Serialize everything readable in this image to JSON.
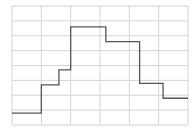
{
  "chart_data": {
    "type": "line",
    "style": "step",
    "title": "",
    "xlabel": "",
    "ylabel": "",
    "grid": true,
    "legend": null,
    "xlim": [
      0,
      6
    ],
    "ylim": [
      0,
      8
    ],
    "x_gridlines": [
      0,
      1,
      2,
      3,
      4,
      5,
      6
    ],
    "y_gridlines": [
      0,
      1,
      2,
      3,
      4,
      5,
      6,
      7,
      8
    ],
    "series": [
      {
        "name": "step",
        "color": "#555555",
        "x": [
          0,
          1.0,
          1.6,
          2.0,
          3.2,
          4.35,
          5.15,
          6.0
        ],
        "y": [
          0.8,
          2.7,
          3.7,
          6.6,
          5.6,
          2.8,
          1.8,
          1.8
        ]
      }
    ]
  },
  "colors": {
    "grid": "#d4d4d4",
    "line": "#555555",
    "background": "#ffffff"
  }
}
